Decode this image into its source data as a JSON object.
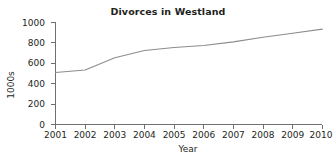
{
  "chart_data": {
    "type": "line",
    "title": "Divorces in Westland",
    "xlabel": "Year",
    "ylabel": "1000s",
    "x": [
      2001,
      2002,
      2003,
      2004,
      2005,
      2006,
      2007,
      2008,
      2009,
      2010
    ],
    "categories": [
      "2001",
      "2002",
      "2003",
      "2004",
      "2005",
      "2006",
      "2007",
      "2008",
      "2009",
      "2010"
    ],
    "values": [
      510,
      535,
      655,
      725,
      755,
      775,
      810,
      855,
      895,
      935
    ],
    "series": [
      {
        "name": "Divorces",
        "values": [
          510,
          535,
          655,
          725,
          755,
          775,
          810,
          855,
          895,
          935
        ]
      }
    ],
    "xlim": [
      2001,
      2010
    ],
    "ylim": [
      0,
      1000
    ],
    "y_ticks": [
      0,
      200,
      400,
      600,
      800,
      1000
    ],
    "y_tick_labels": [
      "0",
      "200",
      "400",
      "600",
      "800",
      "1000"
    ],
    "x_ticks": [
      2001,
      2002,
      2003,
      2004,
      2005,
      2006,
      2007,
      2008,
      2009,
      2010
    ],
    "x_tick_labels": [
      "2001",
      "2002",
      "2003",
      "2004",
      "2005",
      "2006",
      "2007",
      "2008",
      "2009",
      "2010"
    ],
    "grid": false,
    "legend": false,
    "legend_position": "none",
    "line_color": "#8c8c8e",
    "axis_color": "#6f6f70",
    "text_color": "#231f20",
    "background_color": "#ffffff"
  }
}
